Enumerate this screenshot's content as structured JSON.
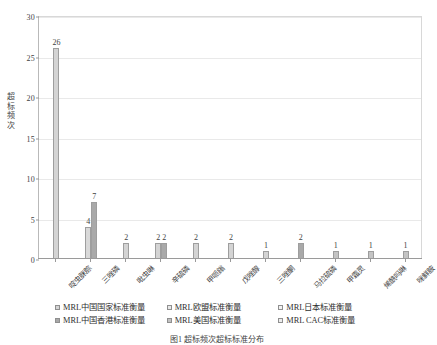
{
  "chart_data": {
    "type": "bar",
    "title": "",
    "xlabel": "",
    "ylabel": "超标频次",
    "ylim": [
      0,
      30
    ],
    "ytick_values": [
      0,
      5,
      10,
      15,
      20,
      25,
      30
    ],
    "ytick_labels": [
      "0",
      "5",
      "10",
      "15",
      "20",
      "25",
      "30"
    ],
    "grid": true,
    "legend_position": "bottom",
    "categories": [
      "啶虫脒腙",
      "三唑磷",
      "吡虫啉",
      "辛硫磷",
      "甲哌鎓",
      "戊唑醇",
      "三唑酮",
      "马拉硫磷",
      "甲霜灵",
      "烯酰吗啉",
      "咪鲜胺"
    ],
    "series": [
      {
        "name": "MRL中国国家标准衡量",
        "color": "#d4d4d4",
        "values": [
          26,
          4,
          2,
          2,
          2,
          2,
          1,
          2,
          1,
          1,
          1
        ]
      },
      {
        "name": "MRL欧盟标准衡量",
        "color": "#e8e8e8",
        "values": [
          0,
          0,
          0,
          0,
          0,
          0,
          0,
          0,
          0,
          0,
          0
        ]
      },
      {
        "name": "MRL日本标准衡量",
        "color": "#f2f2f2",
        "values": [
          0,
          0,
          0,
          0,
          0,
          0,
          0,
          0,
          0,
          0,
          0
        ]
      },
      {
        "name": "MRL中国香港标准衡量",
        "color": "#a8a8a8",
        "values": [
          0,
          7,
          0,
          2,
          0,
          0,
          0,
          0,
          0,
          0,
          0
        ]
      },
      {
        "name": "MRL美国标准衡量",
        "color": "#c2c2c2",
        "values": [
          0,
          0,
          0,
          0,
          0,
          0,
          0,
          0,
          0,
          0,
          0
        ]
      },
      {
        "name": "MRL CAC标准衡量",
        "color": "#ededed",
        "values": [
          0,
          0,
          0,
          0,
          0,
          0,
          0,
          0,
          0,
          0,
          0
        ]
      }
    ],
    "bar_groups": [
      {
        "category": "啶虫脒腙",
        "bars": [
          {
            "series": "MRL中国国家标准衡量",
            "value": 26,
            "label": "26",
            "color": "#d4d4d4"
          }
        ]
      },
      {
        "category": "三唑磷",
        "bars": [
          {
            "series": "MRL中国国家标准衡量",
            "value": 4,
            "label": "4",
            "color": "#d9d9d9"
          },
          {
            "series": "MRL中国香港标准衡量",
            "value": 7,
            "label": "7",
            "color": "#a9a9a9"
          }
        ]
      },
      {
        "category": "吡虫啉",
        "bars": [
          {
            "series": "MRL中国国家标准衡量",
            "value": 2,
            "label": "2",
            "color": "#d4d4d4"
          }
        ]
      },
      {
        "category": "辛硫磷",
        "bars": [
          {
            "series": "MRL中国国家标准衡量",
            "value": 2,
            "label": "2",
            "color": "#d4d4d4"
          },
          {
            "series": "MRL中国香港标准衡量",
            "value": 2,
            "label": "2",
            "color": "#a9a9a9"
          }
        ]
      },
      {
        "category": "甲哌鎓",
        "bars": [
          {
            "series": "MRL中国国家标准衡量",
            "value": 2,
            "label": "2",
            "color": "#d4d4d4"
          }
        ]
      },
      {
        "category": "戊唑醇",
        "bars": [
          {
            "series": "MRL中国国家标准衡量",
            "value": 2,
            "label": "2",
            "color": "#d4d4d4"
          }
        ]
      },
      {
        "category": "三唑酮",
        "bars": [
          {
            "series": "MRL中国国家标准衡量",
            "value": 1,
            "label": "1",
            "color": "#d4d4d4"
          }
        ]
      },
      {
        "category": "马拉硫磷",
        "bars": [
          {
            "series": "MRL中国国家标准衡量",
            "value": 2,
            "label": "2",
            "color": "#a9a9a9"
          }
        ]
      },
      {
        "category": "甲霜灵",
        "bars": [
          {
            "series": "MRL中国国家标准衡量",
            "value": 1,
            "label": "1",
            "color": "#c4c4c4"
          }
        ]
      },
      {
        "category": "烯酰吗啉",
        "bars": [
          {
            "series": "MRL中国国家标准衡量",
            "value": 1,
            "label": "1",
            "color": "#c4c4c4"
          }
        ]
      },
      {
        "category": "咪鲜胺",
        "bars": [
          {
            "series": "MRL中国国家标准衡量",
            "value": 1,
            "label": "1",
            "color": "#c4c4c4"
          }
        ]
      }
    ]
  },
  "legend": {
    "items": [
      {
        "label": "MRL中国国家标准衡量",
        "color": "#d4d4d4"
      },
      {
        "label": "MRL欧盟标准衡量",
        "color": "#e8e8e8"
      },
      {
        "label": "MRL日本标准衡量",
        "color": "#f2f2f2"
      },
      {
        "label": "MRL中国香港标准衡量",
        "color": "#a8a8a8"
      },
      {
        "label": "MRL美国标准衡量",
        "color": "#c2c2c2"
      },
      {
        "label": "MRL CAC标准衡量",
        "color": "#ededed"
      }
    ]
  },
  "caption": "图1  超标频次超标标准分布"
}
